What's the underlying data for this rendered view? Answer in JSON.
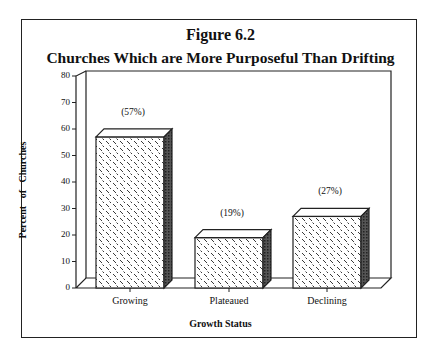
{
  "title": "Figure 6.2",
  "subtitle": "Churches Which are More Purposeful Than Drifting",
  "chart_data": {
    "type": "bar",
    "categories": [
      "Growing",
      "Plateaued",
      "Declining"
    ],
    "values": [
      57,
      19,
      27
    ],
    "data_labels": [
      "(57%)",
      "(19%)",
      "(27%)"
    ],
    "xlabel": "Growth Status",
    "ylabel": "Percent of Churches",
    "ylim": [
      0,
      80
    ],
    "yticks": [
      0,
      10,
      20,
      30,
      40,
      50,
      60,
      70,
      80
    ],
    "grid": false,
    "style": "3d bars with diagonal dash pattern"
  }
}
